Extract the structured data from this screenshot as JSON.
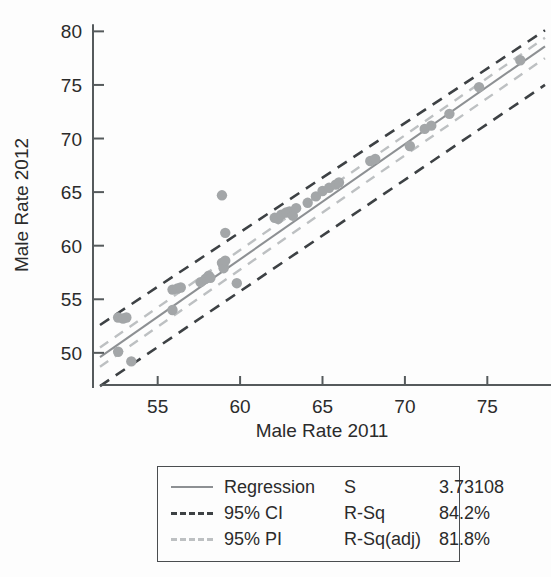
{
  "chart_data": {
    "type": "scatter",
    "title": "",
    "xlabel": "Male Rate 2011",
    "ylabel": "Male Rate 2012",
    "xlim": [
      51.5,
      78.5
    ],
    "ylim": [
      47.0,
      80.5
    ],
    "xticks": [
      55,
      60,
      65,
      70,
      75
    ],
    "yticks": [
      50,
      55,
      60,
      65,
      70,
      75,
      80
    ],
    "grid": false,
    "legend_position": "below-axes",
    "series": [
      {
        "name": "Data",
        "type": "scatter",
        "marker_color": "#a3a6a8",
        "points": [
          [
            52.6,
            53.3
          ],
          [
            52.9,
            53.2
          ],
          [
            53.1,
            53.3
          ],
          [
            52.6,
            50.1
          ],
          [
            53.4,
            49.2
          ],
          [
            55.9,
            55.9
          ],
          [
            55.9,
            54.0
          ],
          [
            56.2,
            56.0
          ],
          [
            56.4,
            56.1
          ],
          [
            57.6,
            56.6
          ],
          [
            57.9,
            56.9
          ],
          [
            58.1,
            57.2
          ],
          [
            58.2,
            57.0
          ],
          [
            58.9,
            58.4
          ],
          [
            59.0,
            58.1
          ],
          [
            59.0,
            57.9
          ],
          [
            59.1,
            58.6
          ],
          [
            58.9,
            64.7
          ],
          [
            59.1,
            61.2
          ],
          [
            59.8,
            56.5
          ],
          [
            62.1,
            62.6
          ],
          [
            62.3,
            62.5
          ],
          [
            62.5,
            62.9
          ],
          [
            62.8,
            63.1
          ],
          [
            63.0,
            63.2
          ],
          [
            63.2,
            62.8
          ],
          [
            63.4,
            63.5
          ],
          [
            64.1,
            64.0
          ],
          [
            64.6,
            64.6
          ],
          [
            65.0,
            65.1
          ],
          [
            65.4,
            65.4
          ],
          [
            65.8,
            65.7
          ],
          [
            66.0,
            65.9
          ],
          [
            67.9,
            67.9
          ],
          [
            68.2,
            68.1
          ],
          [
            70.3,
            69.3
          ],
          [
            71.2,
            70.9
          ],
          [
            71.6,
            71.2
          ],
          [
            72.7,
            72.3
          ],
          [
            74.5,
            74.8
          ],
          [
            77.0,
            77.3
          ]
        ]
      },
      {
        "name": "Regression",
        "type": "line",
        "style": "solid",
        "color": "#8d9093",
        "endpoints": [
          [
            51.5,
            49.6
          ],
          [
            78.5,
            78.6
          ]
        ]
      },
      {
        "name": "95% CI",
        "type": "band",
        "style": "dashed",
        "color": "#3d4144",
        "upper_endpoints": [
          [
            51.5,
            52.6
          ],
          [
            78.5,
            80.1
          ]
        ],
        "lower_endpoints": [
          [
            51.5,
            46.9
          ],
          [
            78.5,
            75.0
          ]
        ]
      },
      {
        "name": "95% PI",
        "type": "band",
        "style": "dashed",
        "color": "#bdc0c2",
        "upper_endpoints": [
          [
            51.5,
            50.5
          ],
          [
            78.5,
            79.4
          ]
        ],
        "lower_endpoints": [
          [
            51.5,
            48.7
          ],
          [
            78.5,
            77.5
          ]
        ]
      }
    ]
  },
  "axes": {
    "x_title": "Male Rate 2011",
    "y_title": "Male Rate 2012",
    "x_tick_labels": [
      "55",
      "60",
      "65",
      "70",
      "75"
    ],
    "y_tick_labels": [
      "50",
      "55",
      "60",
      "65",
      "70",
      "75",
      "80"
    ]
  },
  "legend": {
    "rows": [
      {
        "label": "Regression",
        "stat_name": "S",
        "stat_value": "3.73108",
        "swatch": "solid-line-swatch"
      },
      {
        "label": "95% CI",
        "stat_name": "R-Sq",
        "stat_value": "84.2%",
        "swatch": "dashed-dark-line-swatch"
      },
      {
        "label": "95% PI",
        "stat_name": "R-Sq(adj)",
        "stat_value": "81.8%",
        "swatch": "dashed-light-line-swatch"
      }
    ]
  },
  "colors": {
    "regression": "#8d9093",
    "ci": "#3d4144",
    "pi": "#bdc0c2",
    "points": "#a3a6a8",
    "axis": "#555a5c",
    "background": "#fdfdfd"
  }
}
